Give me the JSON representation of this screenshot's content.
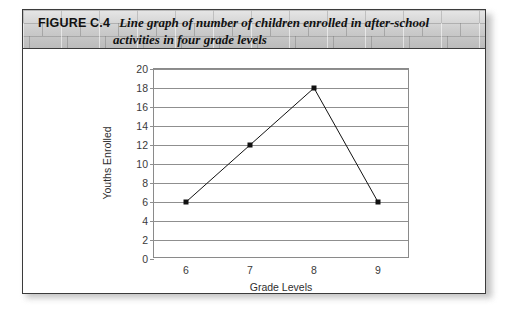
{
  "figure": {
    "tag": "FIGURE C.4",
    "caption_line1": "Line graph of number of children enrolled in after-school",
    "caption_line2": "activities in four grade levels"
  },
  "chart_data": {
    "type": "line",
    "title": "",
    "xlabel": "Grade Levels",
    "ylabel": "Youths Enrolled",
    "categories": [
      "6",
      "7",
      "8",
      "9"
    ],
    "values": [
      6,
      12,
      18,
      6
    ],
    "x": [
      6,
      7,
      8,
      9
    ],
    "ylim": [
      0,
      20
    ],
    "ytick_step": 2,
    "yticks": [
      "20",
      "18",
      "16",
      "14",
      "12",
      "10",
      "8",
      "6",
      "4",
      "2",
      "0"
    ],
    "grid": true,
    "legend": "none",
    "marker": "square",
    "line_color": "#111111",
    "grid_color": "#8f8f8f"
  }
}
